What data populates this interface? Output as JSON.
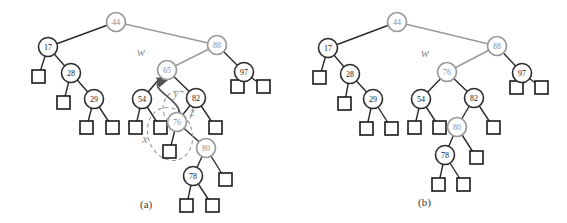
{
  "figure": {
    "type": "binary-search-tree-restructure-diagram",
    "panels": [
      {
        "id": "a",
        "caption": "(a)",
        "caption_pos": [
          140,
          198
        ],
        "labels": [
          {
            "text": "w",
            "x": 141,
            "y": 56,
            "color": "#8c8c8c"
          },
          {
            "text": "y",
            "x": 176,
            "y": 97,
            "color": "#8c8c8c"
          },
          {
            "text": "x",
            "x": 145,
            "y": 143,
            "color": "#8c8c8c"
          },
          {
            "text": "z",
            "x": 192,
            "y": 116,
            "color": "#8c8c8c"
          }
        ],
        "nodes": [
          {
            "key": "44",
            "x": 116,
            "y": 22,
            "color": "gray"
          },
          {
            "key": "17",
            "x": 48,
            "y": 47,
            "color": "black"
          },
          {
            "key": "88",
            "x": 217,
            "y": 45,
            "color": "gray"
          },
          {
            "key": "28",
            "x": 71,
            "y": 73,
            "color": "black"
          },
          {
            "key": "65",
            "x": 167,
            "y": 70,
            "color": "gray"
          },
          {
            "key": "97",
            "x": 244,
            "y": 72,
            "color": "black"
          },
          {
            "key": "29",
            "x": 94,
            "y": 99,
            "color": "black"
          },
          {
            "key": "54",
            "x": 142,
            "y": 99,
            "color": "black"
          },
          {
            "key": "82",
            "x": 196,
            "y": 98,
            "color": "black"
          },
          {
            "key": "76",
            "x": 177,
            "y": 122,
            "color": "gray"
          },
          {
            "key": "80",
            "x": 206,
            "y": 148,
            "color": "gray"
          },
          {
            "key": "78",
            "x": 193,
            "y": 176,
            "color": "black"
          }
        ],
        "leaves": [
          {
            "x": 32,
            "y": 70
          },
          {
            "x": 57,
            "y": 96
          },
          {
            "x": 80,
            "y": 121
          },
          {
            "x": 106,
            "y": 121
          },
          {
            "x": 129,
            "y": 121
          },
          {
            "x": 154,
            "y": 121
          },
          {
            "x": 163,
            "y": 145
          },
          {
            "x": 209,
            "y": 121
          },
          {
            "x": 231,
            "y": 80
          },
          {
            "x": 257,
            "y": 80
          },
          {
            "x": 219,
            "y": 173
          },
          {
            "x": 180,
            "y": 199
          },
          {
            "x": 206,
            "y": 199
          }
        ],
        "edges": [
          [
            "44",
            "17",
            "black"
          ],
          [
            "44",
            "88",
            "gray"
          ],
          [
            "17",
            "L0",
            "black"
          ],
          [
            "17",
            "28",
            "black"
          ],
          [
            "28",
            "L1",
            "black"
          ],
          [
            "28",
            "29",
            "black"
          ],
          [
            "29",
            "L2",
            "black"
          ],
          [
            "29",
            "L3",
            "black"
          ],
          [
            "88",
            "65",
            "gray"
          ],
          [
            "88",
            "97",
            "black"
          ],
          [
            "97",
            "L8",
            "black"
          ],
          [
            "97",
            "L9",
            "black"
          ],
          [
            "65",
            "54",
            "black"
          ],
          [
            "65",
            "82",
            "black"
          ],
          [
            "54",
            "L4",
            "black"
          ],
          [
            "54",
            "L5",
            "black"
          ],
          [
            "82",
            "76",
            "black"
          ],
          [
            "82",
            "L7",
            "black"
          ],
          [
            "76",
            "Lx",
            "black"
          ],
          [
            "76",
            "80",
            "black"
          ],
          [
            "80",
            "78",
            "black"
          ],
          [
            "80",
            "L10",
            "black"
          ],
          [
            "78",
            "L11",
            "black"
          ],
          [
            "78",
            "L12",
            "black"
          ]
        ],
        "annotations": {
          "selection_ellipse": {
            "cx": 170,
            "cy": 134,
            "rx": 22,
            "ry": 27,
            "rot": -20,
            "style": "dashed",
            "color": "#9a9a9a"
          },
          "loop_ellipse": {
            "cx": 178,
            "cy": 108,
            "rx": 15,
            "ry": 17,
            "style": "dashed",
            "color": "#9a9a9a"
          },
          "move_arrow": {
            "from": [
              176,
              118
            ],
            "to": [
              163,
              81
            ],
            "color": "#555555",
            "label": "move 76 up into 65's place"
          }
        }
      },
      {
        "id": "b",
        "caption": "(b)",
        "caption_pos": [
          418,
          196
        ],
        "labels": [
          {
            "text": "w",
            "x": 425,
            "y": 57,
            "color": "#8c8c8c"
          }
        ],
        "nodes": [
          {
            "key": "44",
            "x": 397,
            "y": 22,
            "color": "gray"
          },
          {
            "key": "17",
            "x": 328,
            "y": 48,
            "color": "black"
          },
          {
            "key": "88",
            "x": 497,
            "y": 46,
            "color": "gray"
          },
          {
            "key": "28",
            "x": 350,
            "y": 74,
            "color": "black"
          },
          {
            "key": "76",
            "x": 447,
            "y": 72,
            "color": "gray"
          },
          {
            "key": "97",
            "x": 522,
            "y": 73,
            "color": "black"
          },
          {
            "key": "29",
            "x": 373,
            "y": 99,
            "color": "black"
          },
          {
            "key": "54",
            "x": 421,
            "y": 99,
            "color": "black"
          },
          {
            "key": "82",
            "x": 474,
            "y": 98,
            "color": "black"
          },
          {
            "key": "80",
            "x": 457,
            "y": 127,
            "color": "gray"
          },
          {
            "key": "78",
            "x": 445,
            "y": 155,
            "color": "black"
          }
        ],
        "leaves": [
          {
            "x": 313,
            "y": 71
          },
          {
            "x": 338,
            "y": 97
          },
          {
            "x": 360,
            "y": 122
          },
          {
            "x": 385,
            "y": 122
          },
          {
            "x": 408,
            "y": 121
          },
          {
            "x": 433,
            "y": 121
          },
          {
            "x": 487,
            "y": 121
          },
          {
            "x": 510,
            "y": 81
          },
          {
            "x": 535,
            "y": 81
          },
          {
            "x": 470,
            "y": 151
          },
          {
            "x": 432,
            "y": 178
          },
          {
            "x": 457,
            "y": 178
          }
        ],
        "edges": [
          [
            "44",
            "17",
            "black"
          ],
          [
            "44",
            "88",
            "gray"
          ],
          [
            "17",
            "L0",
            "black"
          ],
          [
            "17",
            "28",
            "black"
          ],
          [
            "28",
            "L1",
            "black"
          ],
          [
            "28",
            "29",
            "black"
          ],
          [
            "29",
            "L2",
            "black"
          ],
          [
            "29",
            "L3",
            "black"
          ],
          [
            "88",
            "76",
            "gray"
          ],
          [
            "88",
            "97",
            "black"
          ],
          [
            "97",
            "L7",
            "black"
          ],
          [
            "97",
            "L8",
            "black"
          ],
          [
            "76",
            "54",
            "black"
          ],
          [
            "76",
            "82",
            "black"
          ],
          [
            "54",
            "L4",
            "black"
          ],
          [
            "54",
            "L5",
            "black"
          ],
          [
            "82",
            "80",
            "black"
          ],
          [
            "82",
            "L6",
            "black"
          ],
          [
            "80",
            "78",
            "black"
          ],
          [
            "80",
            "L9",
            "black"
          ],
          [
            "78",
            "L10",
            "black"
          ],
          [
            "78",
            "L11",
            "black"
          ]
        ]
      }
    ],
    "colors": {
      "gray_node_stroke": "#9a9a9a",
      "gray_node_text": "#8c8c8c",
      "black_node_stroke": "#2b2b2b",
      "black_node_text": "#1a1a1a",
      "leaf_stroke": "#1a1a1a",
      "background": "#ffffff",
      "annotation": "#9a9a9a"
    },
    "geometry": {
      "node_radius": 9.5,
      "leaf_size": 13
    }
  }
}
